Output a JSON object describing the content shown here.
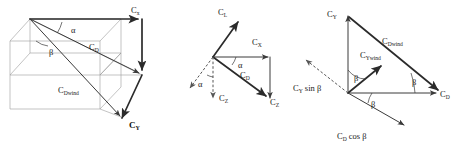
{
  "figure": {
    "background_color": "#ffffff",
    "vector_color": "#2b2b2b",
    "construction_line_color": "#9a9a9a",
    "dashed_color": "#555555",
    "panel_count": 3
  },
  "panels": [
    {
      "id": "panel-left",
      "name": "three-dimensional-force-box",
      "type": "3d-box-vector-diagram",
      "labels": {
        "cx": {
          "base": "C",
          "sub": "x",
          "bold": false
        },
        "cd": {
          "base": "C",
          "sub": "D",
          "bold": false
        },
        "cdwind": {
          "base": "C",
          "sub": "Dwind",
          "bold": false
        },
        "cy": {
          "base": "C",
          "sub": "Y",
          "bold": true
        },
        "alpha": "α",
        "beta": "β"
      }
    },
    {
      "id": "panel-middle",
      "name": "lift-drag-alpha-rotation",
      "type": "2d-vector-triangle",
      "labels": {
        "cl": {
          "base": "C",
          "sub": "L",
          "bold": false
        },
        "cx": {
          "base": "C",
          "sub": "X",
          "bold": false
        },
        "cd": {
          "base": "C",
          "sub": "D",
          "bold": false
        },
        "cz_right": {
          "base": "C",
          "sub": "Z",
          "bold": false
        },
        "cz_down": {
          "base": "C",
          "sub": "Z",
          "bold": false
        },
        "alpha_upper": "α",
        "alpha_lower": "α"
      }
    },
    {
      "id": "panel-right",
      "name": "sideslip-beta-rotation",
      "type": "2d-vector-triangle",
      "labels": {
        "cy": {
          "base": "C",
          "sub": "Y",
          "bold": false
        },
        "cdwind": {
          "base": "C",
          "sub": "Dwind",
          "bold": false
        },
        "cywind": {
          "base": "C",
          "sub": "Ywind",
          "bold": false
        },
        "cd": {
          "base": "C",
          "sub": "D",
          "bold": false
        },
        "cy_sin_beta": {
          "base": "C",
          "sub": "Y",
          "tail": " sin β"
        },
        "cd_cos_beta": {
          "base": "C",
          "sub": "D",
          "tail": " cos β"
        },
        "beta_upper": "β",
        "beta_lower": "β",
        "beta_right": "β"
      }
    }
  ]
}
